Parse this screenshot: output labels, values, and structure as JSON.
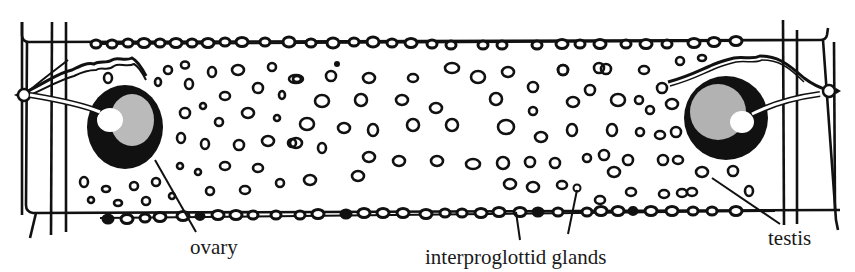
{
  "figure": {
    "colors": {
      "ink": "#111111",
      "paper": "#ffffff",
      "stipple": "#f4f4f4"
    }
  },
  "labels": {
    "ovary": "ovary",
    "interproglottid_glands": "interproglottid glands",
    "testis": "testis"
  },
  "structures": [
    {
      "id": "left-ovary",
      "label_key": "ovary"
    },
    {
      "id": "right-ovary",
      "label_key": "ovary"
    },
    {
      "id": "interproglottid-glands",
      "label_key": "interproglottid_glands",
      "position": "bottom margin chain"
    },
    {
      "id": "testes",
      "label_key": "testis",
      "position": "scattered in medulla"
    }
  ]
}
